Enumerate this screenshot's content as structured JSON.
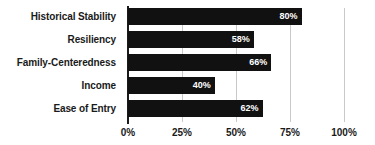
{
  "chart_data": {
    "type": "bar",
    "orientation": "horizontal",
    "title": "",
    "subtitle": "",
    "xlabel": "",
    "ylabel": "",
    "categories": [
      "Historical Stability",
      "Resiliency",
      "Family-Centeredness",
      "Income",
      "Ease of Entry"
    ],
    "values": [
      80,
      58,
      66,
      40,
      62
    ],
    "value_labels": [
      "80%",
      "58%",
      "66%",
      "40%",
      "62%"
    ],
    "xlim": [
      0,
      100
    ],
    "xticks": [
      0,
      25,
      50,
      75,
      100
    ],
    "xtick_labels": [
      "0%",
      "25%",
      "50%",
      "75%",
      "100%"
    ],
    "grid": true,
    "grid_axis": "x",
    "legend": false,
    "legend_position": "none",
    "bar_color": "#111111",
    "value_label_color": "#ffffff",
    "gridline_color": "#c9c9c9",
    "axis_color": "#1a1a1a",
    "text_color": "#1a1a1a",
    "background_color": "#ffffff"
  }
}
